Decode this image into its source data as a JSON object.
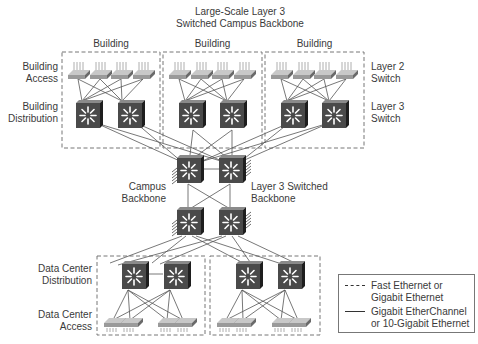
{
  "title": {
    "line1": "Large-Scale Layer 3",
    "line2": "Switched Campus Backbone"
  },
  "buildings": [
    {
      "label": "Building"
    },
    {
      "label": "Building"
    },
    {
      "label": "Building"
    }
  ],
  "left_labels": {
    "building_access": [
      "Building",
      "Access"
    ],
    "building_distribution": [
      "Building",
      "Distribution"
    ],
    "campus_backbone": [
      "Campus",
      "Backbone"
    ],
    "dc_distribution": [
      "Data Center",
      "Distribution"
    ],
    "dc_access": [
      "Data Center",
      "Access"
    ]
  },
  "right_labels": {
    "layer2": [
      "Layer 2",
      "Switch"
    ],
    "layer3": [
      "Layer 3",
      "Switch"
    ],
    "l3_backbone": [
      "Layer 3 Switched",
      "Backbone"
    ]
  },
  "legend": {
    "items": [
      {
        "style": "dashed",
        "line1": "Fast Ethernet or",
        "line2": "Gigabit Ethernet"
      },
      {
        "style": "solid",
        "line1": "Gigabit EtherChannel",
        "line2": "or 10-Gigabit Ethernet"
      }
    ]
  },
  "colors": {
    "switch_face": "#4a4a4a",
    "switch_side": "#1e1e1e",
    "switch_top": "#7a7a7a",
    "link": "#555555",
    "box_dash": "#777777",
    "access_switch": "#9a9a9a"
  },
  "icons": {
    "layer3_switch": "multilayer-switch-icon",
    "layer2_switch": "workgroup-switch-icon"
  }
}
